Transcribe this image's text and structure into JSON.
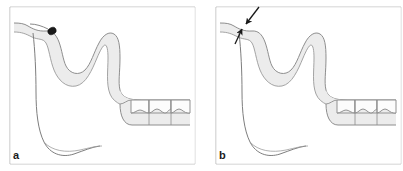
{
  "figure": {
    "background_color": "#ffffff",
    "width": 403,
    "height": 171
  },
  "panels": [
    {
      "id": "a",
      "label": "a",
      "description": "Cross-section of palate and alveolar ridge with posterior teeth; a filled dark oval marker indicates a point on the anterior palatal contour.",
      "marker": {
        "type": "filled-oval-marker",
        "name": "point-marker",
        "cx": 52,
        "cy": 31,
        "rx": 4.2,
        "ry": 3.4,
        "rotation": -25,
        "color": "#1a1a1a"
      },
      "arrows": []
    },
    {
      "id": "b",
      "label": "b",
      "description": "Same cross-section; two converging arrows indicate the same anterior palatal point from above and from below.",
      "marker": null,
      "arrows": [
        {
          "name": "arrow-from-above",
          "from": [
            52,
            6
          ],
          "to": [
            39,
            24
          ],
          "color": "#1a1a1a"
        },
        {
          "name": "arrow-from-below",
          "from": [
            30,
            43
          ],
          "to": [
            36,
            28
          ],
          "color": "#1a1a1a"
        }
      ]
    }
  ],
  "anatomy": {
    "outline_stroke": "#6e6e6e",
    "soft_tissue_fill": "#ececec",
    "soft_tissue_stroke": "#8c8c8c",
    "tooth_fill": "#fbfbfb",
    "tooth_stroke": "#7a7a7a",
    "frame_stroke": "#b9b9b9",
    "structures": [
      {
        "name": "frame-border",
        "label": "Panel frame"
      },
      {
        "name": "palatal-vault-outline",
        "label": "Palatal vault and nasal floor outline"
      },
      {
        "name": "soft-tissue-band",
        "label": "Mucosa / soft tissue band"
      },
      {
        "name": "alveolar-ridge",
        "label": "Alveolar ridge"
      },
      {
        "name": "tooth-1",
        "label": "Posterior tooth 1"
      },
      {
        "name": "tooth-2",
        "label": "Posterior tooth 2"
      },
      {
        "name": "tooth-3",
        "label": "Posterior tooth 3"
      },
      {
        "name": "occlusal-plane-line",
        "label": "Occlusal plane line"
      },
      {
        "name": "tongue-floor-contour",
        "label": "Inferior contour / floor of mouth"
      }
    ]
  }
}
